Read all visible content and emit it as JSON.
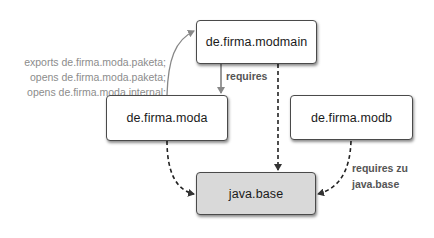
{
  "diagram": {
    "type": "module-dependency-graph",
    "nodes": [
      {
        "id": "modmain",
        "label": "de.firma.modmain",
        "fill": "#ffffff"
      },
      {
        "id": "moda",
        "label": "de.firma.moda",
        "fill": "#ffffff"
      },
      {
        "id": "modb",
        "label": "de.firma.modb",
        "fill": "#ffffff"
      },
      {
        "id": "javabase",
        "label": "java.base",
        "fill": "#d9d9d9"
      }
    ],
    "edges": [
      {
        "from": "modmain",
        "to": "moda",
        "style": "solid",
        "label": "requires"
      },
      {
        "from": "moda",
        "to": "modmain",
        "style": "solid-curved",
        "label": "module-declaration"
      },
      {
        "from": "modmain",
        "to": "javabase",
        "style": "dashed",
        "label": ""
      },
      {
        "from": "moda",
        "to": "javabase",
        "style": "dashed-curved",
        "label": ""
      },
      {
        "from": "modb",
        "to": "javabase",
        "style": "dashed-curved",
        "label": "requires zu java.base"
      }
    ],
    "moda_declaration": [
      "exports de.firma.moda.paketa;",
      "opens de.firma.moda.paketa;",
      "opens de.firma.moda.internal;"
    ],
    "requires_label": "requires",
    "modb_requires_label": [
      "requires zu",
      "java.base"
    ]
  },
  "colors": {
    "box_border": "#4a4a4a",
    "base_fill": "#d9d9d9",
    "declaration_text": "#8c8c8c",
    "edge_label_text": "#555555"
  }
}
